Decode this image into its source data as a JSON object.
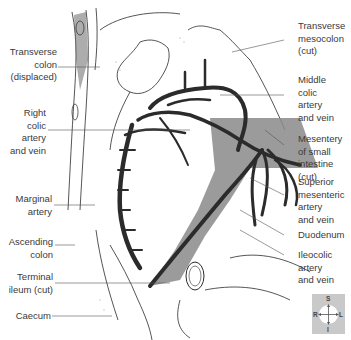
{
  "diagram": {
    "type": "anatomical-illustration",
    "colors": {
      "background": "#ffffff",
      "outline": "#2a2a2a",
      "vessels_dark": "#2b2b2b",
      "mesentery_grey": "#8a8a8a",
      "label_text": "#3a3a3a",
      "leader_line": "#555555",
      "compass_bg": "#c9c9c9"
    }
  },
  "labels_left": [
    {
      "id": "transverse-colon",
      "text": "Transverse\ncolon\n(displaced)"
    },
    {
      "id": "right-colic",
      "text": "Right\ncolic\nartery\nand vein"
    },
    {
      "id": "marginal-artery",
      "text": "Marginal\nartery"
    },
    {
      "id": "ascending-colon",
      "text": "Ascending\ncolon"
    },
    {
      "id": "terminal-ileum",
      "text": "Terminal\nileum (cut)"
    },
    {
      "id": "caecum",
      "text": "Caecum"
    }
  ],
  "labels_right": [
    {
      "id": "transverse-mesocolon",
      "text": "Transverse\nmesocolon\n(cut)"
    },
    {
      "id": "middle-colic",
      "text": "Middle\ncolic\nartery\nand vein"
    },
    {
      "id": "mesentery-small-intestine",
      "text": "Mesentery\nof small\nintestine (cut)"
    },
    {
      "id": "superior-mesenteric",
      "text": "Superior\nmesenteric\nartery\nand vein"
    },
    {
      "id": "duodenum",
      "text": "Duodenum"
    },
    {
      "id": "ileocolic",
      "text": "Ileocolic\nartery\nand vein"
    }
  ],
  "compass": {
    "superior": "S",
    "inferior": "I",
    "right": "R",
    "left": "L"
  }
}
